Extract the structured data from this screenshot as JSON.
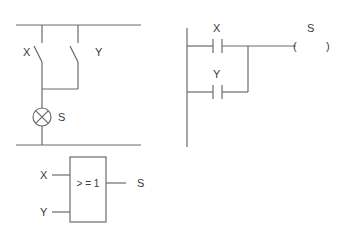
{
  "circuit_diagram": {
    "switch_1_label": "X",
    "switch_2_label": "Y",
    "lamp_label": "S"
  },
  "ladder_diagram": {
    "contact_1_label": "X",
    "contact_2_label": "Y",
    "coil_label": "S",
    "coil_open": "(",
    "coil_close": ")"
  },
  "logic_gate": {
    "input_1_label": "X",
    "input_2_label": "Y",
    "output_label": "S",
    "function_label": "> = 1"
  },
  "colors": {
    "line": "#6b6b6b",
    "text": "#3a3a3a",
    "background": "#ffffff"
  }
}
